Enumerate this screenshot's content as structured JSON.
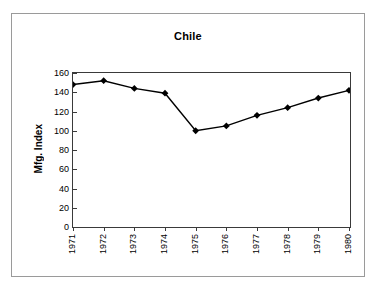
{
  "figure": {
    "title": "Chile",
    "border_color": "#9a9a9a",
    "plot_border_color": "#3a3a3a",
    "series_color": "#000000"
  },
  "chart_data": {
    "type": "line",
    "title": "Chile",
    "xlabel": "",
    "ylabel": "Mfg. Index",
    "categories": [
      "1971",
      "1972",
      "1973",
      "1974",
      "1975",
      "1976",
      "1977",
      "1978",
      "1979",
      "1980"
    ],
    "values": [
      148,
      152,
      144,
      139,
      100,
      105,
      116,
      124,
      134,
      142
    ],
    "series": [
      {
        "name": "Mfg. Index",
        "values": [
          148,
          152,
          144,
          139,
          100,
          105,
          116,
          124,
          134,
          142
        ]
      }
    ],
    "ylim": [
      0,
      160
    ],
    "ytick_labels": [
      "0",
      "20",
      "40",
      "60",
      "80",
      "100",
      "120",
      "140",
      "160"
    ],
    "yticks": [
      0,
      20,
      40,
      60,
      80,
      100,
      120,
      140,
      160
    ],
    "xtick_labels": [
      "1971",
      "1972",
      "1973",
      "1974",
      "1975",
      "1976",
      "1977",
      "1978",
      "1979",
      "1980"
    ],
    "grid": false,
    "legend": false,
    "marker": "diamond",
    "xtick_rotation": 90
  }
}
